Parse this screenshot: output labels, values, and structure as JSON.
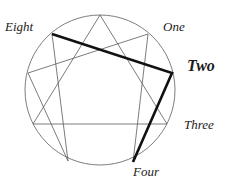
{
  "diagram": {
    "geometry": {
      "center_x": 100,
      "center_y": 90,
      "radius": 75,
      "circle_stroke": "#6e6e6e",
      "thin_stroke": "#5a5a5a",
      "thick_stroke": "#111111",
      "thin_width": 0.8,
      "thick_width": 2.6,
      "background": "#ffffff"
    },
    "points": [
      {
        "number": 9,
        "x": 100,
        "y": 15,
        "label": "",
        "shown": false
      },
      {
        "number": 1,
        "x": 148,
        "y": 34,
        "label": "One",
        "shown": true
      },
      {
        "number": 2,
        "x": 172,
        "y": 73,
        "label": "Two",
        "shown": true
      },
      {
        "number": 3,
        "x": 167,
        "y": 124,
        "label": "Three",
        "shown": true
      },
      {
        "number": 4,
        "x": 133,
        "y": 162,
        "label": "Four",
        "shown": true
      },
      {
        "number": 5,
        "x": 68,
        "y": 161,
        "label": "",
        "shown": false
      },
      {
        "number": 6,
        "x": 33,
        "y": 124,
        "label": "",
        "shown": false
      },
      {
        "number": 7,
        "x": 28,
        "y": 73,
        "label": "",
        "shown": false
      },
      {
        "number": 8,
        "x": 52,
        "y": 34,
        "label": "Eight",
        "shown": true
      }
    ],
    "labels": {
      "eight": "Eight",
      "one": "One",
      "two": "Two",
      "three": "Three",
      "four": "Four"
    },
    "triangle_path": "9-3-6-9",
    "hexad_path": "1-4-2-8-5-7-1",
    "highlighted_path": "8-2-4",
    "highlighted_segments": [
      {
        "from": 8,
        "to": 2
      },
      {
        "from": 2,
        "to": 4
      }
    ]
  }
}
